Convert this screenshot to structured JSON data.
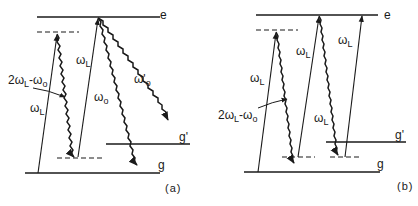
{
  "diagram": {
    "type": "energy-level diagram",
    "panels": [
      {
        "id": "a",
        "caption": "(a)",
        "levels": {
          "excited": "e",
          "ground": "g",
          "ground_prime": "g'"
        },
        "transitions": [
          {
            "label_main": "ω",
            "label_sub": "L",
            "kind": "laser-absorption",
            "from": "g",
            "to": "virtual-upper"
          },
          {
            "label_main": "2ω",
            "label_sub": "L",
            "label_tail": "-ω",
            "label_tail_sub": "o",
            "kind": "emission-wavy",
            "from": "virtual-upper",
            "to": "virtual-lower"
          },
          {
            "label_main": "ω",
            "label_sub": "L",
            "kind": "laser-absorption",
            "from": "virtual-lower",
            "to": "e"
          },
          {
            "label_main": "ω",
            "label_sub": "o",
            "kind": "emission-wavy",
            "from": "e",
            "to": "g"
          },
          {
            "label_main": "ω'",
            "label_sub": "o",
            "kind": "emission-wavy",
            "from": "e",
            "to": "g'"
          }
        ]
      },
      {
        "id": "b",
        "caption": "(b)",
        "levels": {
          "excited": "e",
          "ground": "g",
          "ground_prime": "g'"
        },
        "transitions": [
          {
            "label_main": "ω",
            "label_sub": "L",
            "kind": "laser-absorption",
            "from": "g",
            "to": "virtual-upper"
          },
          {
            "label_main": "2ω",
            "label_sub": "L",
            "label_tail": "-ω",
            "label_tail_sub": "o",
            "kind": "emission-wavy",
            "from": "virtual-upper",
            "to": "virtual-lower"
          },
          {
            "label_main": "ω",
            "label_sub": "L",
            "kind": "laser-absorption",
            "from": "virtual-lower",
            "to": "e"
          },
          {
            "label_main": "ω",
            "label_sub": "L",
            "kind": "emission-wavy",
            "from": "e",
            "to": "virtual-lower-2"
          },
          {
            "label_main": "ω",
            "label_sub": "L",
            "kind": "laser-absorption",
            "from": "virtual-lower-2",
            "to": "e"
          }
        ]
      }
    ],
    "colors": {
      "ink": "#1a1a1a",
      "background": "#ffffff"
    }
  }
}
